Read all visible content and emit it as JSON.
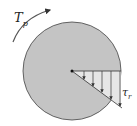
{
  "diagram": {
    "labels": {
      "torque": "T",
      "torque_sub": "p",
      "stress": "τ",
      "stress_sub": "r"
    },
    "colors": {
      "shaft_fill": "#c4c4c4",
      "stroke": "#333333"
    }
  }
}
